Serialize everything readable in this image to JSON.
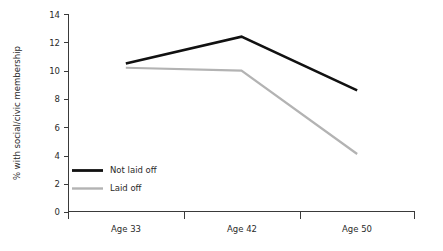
{
  "chart_data": {
    "type": "line",
    "title": "",
    "xlabel": "",
    "ylabel": "% with social/civic membership",
    "categories": [
      "Age 33",
      "Age 42",
      "Age 50"
    ],
    "ylim": [
      0,
      14
    ],
    "yticks": [
      0,
      2,
      4,
      6,
      8,
      10,
      12,
      14
    ],
    "ytick_labels": [
      "0",
      "2",
      "4",
      "6",
      "8",
      "10",
      "12",
      "14"
    ],
    "grid": false,
    "legend_position": "inside-lower-left",
    "series": [
      {
        "name": "Not laid off",
        "values": [
          10.5,
          12.4,
          8.6
        ],
        "color": "#111111",
        "width": 2.6
      },
      {
        "name": "Laid off",
        "values": [
          10.2,
          10.0,
          4.1
        ],
        "color": "#b3b3b3",
        "width": 2.2
      }
    ]
  },
  "axes": {
    "y_title": "% with social/civic membership",
    "y_labels": [
      "14",
      "12",
      "10",
      "8",
      "6",
      "4",
      "2",
      "0"
    ],
    "x_labels": [
      "Age 33",
      "Age 42",
      "Age 50"
    ]
  },
  "legend": {
    "entries": [
      {
        "label": "Not laid off",
        "color": "#111111"
      },
      {
        "label": "Laid off",
        "color": "#b3b3b3"
      }
    ]
  },
  "colors": {
    "background": "#ffffff",
    "axis": "#3a3a3a",
    "text": "#2b2b2b",
    "series_not_laid_off": "#111111",
    "series_laid_off": "#b3b3b3"
  }
}
